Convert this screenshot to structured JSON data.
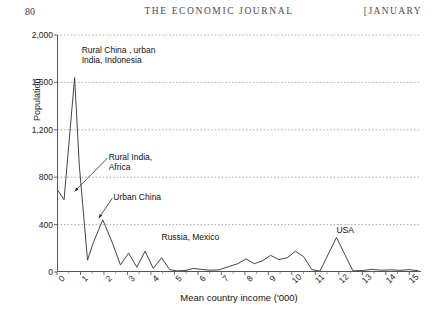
{
  "running_head": {
    "folio": "80",
    "journal": "THE ECONOMIC JOURNAL",
    "issue": "[JANUARY"
  },
  "chart_data": {
    "type": "line",
    "title": "",
    "xlabel": "Mean country income ('000)",
    "ylabel": "Population",
    "xlim": [
      0,
      15.5
    ],
    "ylim": [
      0,
      2000
    ],
    "grid": true,
    "grid_axis": "y",
    "legend": "none",
    "xticks": [
      "0",
      "1",
      "2",
      "3",
      "4",
      "5",
      "6",
      "7",
      "8",
      "9",
      "10",
      "11",
      "12",
      "13",
      "14",
      "15"
    ],
    "yticks": [
      "0",
      "400",
      "800",
      "1,200",
      "1,600",
      "2,000"
    ],
    "x": [
      0.0,
      0.3,
      0.75,
      0.95,
      1.3,
      1.55,
      1.95,
      2.35,
      2.7,
      3.05,
      3.4,
      3.75,
      4.1,
      4.45,
      4.8,
      5.1,
      5.45,
      5.8,
      6.15,
      6.5,
      6.9,
      7.3,
      7.7,
      8.05,
      8.4,
      8.75,
      9.1,
      9.45,
      9.8,
      10.15,
      10.5,
      10.85,
      11.2,
      11.55,
      11.9,
      12.25,
      12.6,
      13.0,
      13.4,
      13.8,
      14.2,
      14.6,
      15.0,
      15.4
    ],
    "y": [
      700,
      610,
      1640,
      900,
      100,
      250,
      440,
      250,
      60,
      160,
      40,
      175,
      30,
      120,
      20,
      10,
      12,
      30,
      22,
      15,
      18,
      45,
      70,
      110,
      70,
      95,
      140,
      105,
      120,
      175,
      130,
      20,
      8,
      150,
      292,
      150,
      10,
      12,
      22,
      15,
      18,
      14,
      20,
      10
    ],
    "annotations": [
      {
        "text": "Rural China , urban\nIndia, Indonesia",
        "x": 1.05,
        "y": 1880,
        "arrow": false
      },
      {
        "text": "Rural India,\nAfrica",
        "x": 2.2,
        "y": 980,
        "arrow": true,
        "arrow_to_x": 0.75,
        "arrow_to_y": 680
      },
      {
        "text": "Urban China",
        "x": 2.4,
        "y": 640,
        "arrow": true,
        "arrow_to_x": 1.78,
        "arrow_to_y": 455
      },
      {
        "text": "Russia, Mexico",
        "x": 4.45,
        "y": 300,
        "arrow": false
      },
      {
        "text": "USA",
        "x": 11.9,
        "y": 360,
        "arrow": false
      }
    ]
  }
}
